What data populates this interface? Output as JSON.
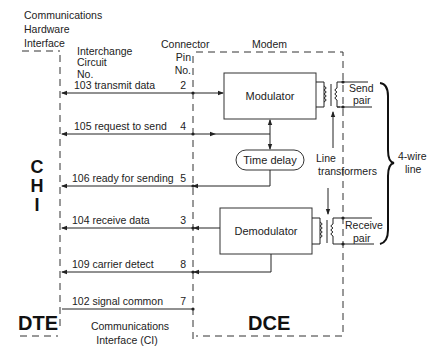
{
  "labels": {
    "chi_title_l1": "Communications",
    "chi_title_l2": "Hardware",
    "chi_title_l3": "Interface",
    "interchange_l1": "Interchange",
    "interchange_l2": "Circuit",
    "interchange_l3": "No.",
    "connector_l1": "Connector",
    "connector_l2": "Pin",
    "connector_l3": "No.",
    "modem": "Modem",
    "chi_c": "C",
    "chi_h": "H",
    "chi_i": "I",
    "dte": "DTE",
    "dce": "DCE",
    "ci_l1": "Communications",
    "ci_l2": "Interface (CI)",
    "line_transformers_l1": "Line",
    "line_transformers_l2": "transformers",
    "send_pair_l1": "Send",
    "send_pair_l2": "pair",
    "receive_pair_l1": "Receive",
    "receive_pair_l2": "pair",
    "four_wire_l1": "4-wire",
    "four_wire_l2": "line"
  },
  "blocks": {
    "modulator": "Modulator",
    "demodulator": "Demodulator",
    "time_delay": "Time delay"
  },
  "circuits": [
    {
      "label": "103 transmit data",
      "pin": "2",
      "direction": "DTE-to-DCE"
    },
    {
      "label": "105 request to send",
      "pin": "4",
      "direction": "DTE-to-DCE"
    },
    {
      "label": "106 ready for sending",
      "pin": "5",
      "direction": "DCE-to-DTE"
    },
    {
      "label": "104 receive data",
      "pin": "3",
      "direction": "DCE-to-DTE"
    },
    {
      "label": "109 carrier detect",
      "pin": "8",
      "direction": "DCE-to-DTE"
    },
    {
      "label": "102 signal common",
      "pin": "7",
      "direction": "common"
    }
  ]
}
